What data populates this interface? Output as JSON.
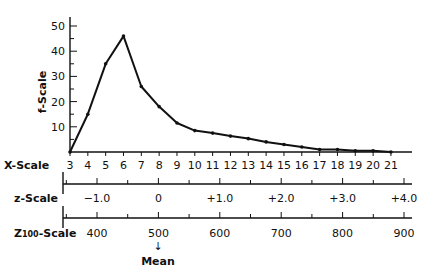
{
  "chart_data": {
    "type": "line",
    "title": "",
    "ylabel": "f-Scale",
    "xlabel": "X-Scale",
    "ylim": [
      0,
      50
    ],
    "yticks": [
      10,
      20,
      30,
      40,
      50
    ],
    "grid": false,
    "x": [
      3,
      4,
      5,
      6,
      7,
      8,
      9,
      10,
      11,
      12,
      13,
      14,
      15,
      16,
      17,
      18,
      19,
      20,
      21
    ],
    "series": [
      {
        "name": "frequency",
        "values": [
          0,
          15,
          35,
          46,
          26,
          18,
          11.5,
          8.5,
          7.5,
          6.3,
          5.3,
          4,
          3,
          2,
          1,
          1,
          0.5,
          0.5,
          0
        ]
      }
    ],
    "secondary_scales": [
      {
        "name": "z-Scale",
        "ticks": [
          "−1.0",
          "0",
          "+1.0",
          "+2.0",
          "+3.0",
          "+4.0"
        ],
        "values": [
          -1.0,
          0,
          1.0,
          2.0,
          3.0,
          4.0
        ]
      },
      {
        "name": "Z100-Scale",
        "ticks": [
          "400",
          "500",
          "600",
          "700",
          "800",
          "900"
        ],
        "values": [
          400,
          500,
          600,
          700,
          800,
          900
        ],
        "annotation": {
          "at": "500",
          "text": "Mean"
        }
      }
    ]
  },
  "labels": {
    "f_scale": "f-Scale",
    "x_scale": "X-Scale",
    "z_scale": "z-Scale",
    "z100_prefix": "Z",
    "z100_sub": "100",
    "z100_suffix": "-Scale",
    "mean": "Mean",
    "mean_arrow": "↓"
  }
}
